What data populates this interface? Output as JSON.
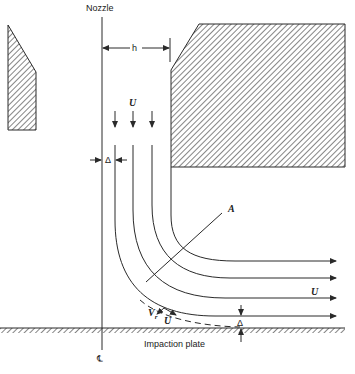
{
  "diagram": {
    "labels": {
      "nozzle": "Nozzle",
      "width": "h",
      "velocity_in": "U",
      "velocity_out": "U",
      "velocity_wall": "U",
      "radial_velocity": "V",
      "radial_subscript": "r",
      "point": "A",
      "gap_top": "Δ",
      "gap_bottom": "Δ",
      "plate": "Impaction plate",
      "centerline": "℄"
    },
    "elements": [
      "nozzle-left-wall",
      "nozzle-right-wall",
      "centerline",
      "streamlines",
      "limiting-streamline-dashed",
      "impaction-plate"
    ],
    "colors": {
      "line": "#2a2a2a",
      "background": "#ffffff"
    }
  }
}
